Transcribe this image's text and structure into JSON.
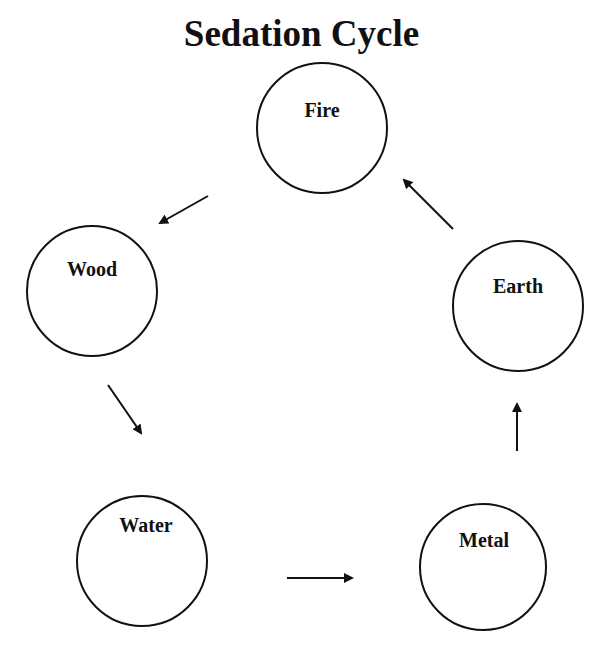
{
  "title": "Sedation Cycle",
  "colors": {
    "stroke": "#111111",
    "background": "#ffffff"
  },
  "nodes": [
    {
      "id": "fire",
      "label": "Fire",
      "cx": 322,
      "cy": 128,
      "r": 65
    },
    {
      "id": "wood",
      "label": "Wood",
      "cx": 92,
      "cy": 291,
      "r": 65
    },
    {
      "id": "earth",
      "label": "Earth",
      "cx": 518,
      "cy": 306,
      "r": 65
    },
    {
      "id": "water",
      "label": "Water",
      "cx": 142,
      "cy": 561,
      "r": 65
    },
    {
      "id": "metal",
      "label": "Metal",
      "cx": 483,
      "cy": 567,
      "r": 63
    }
  ],
  "edges": [
    {
      "from": "Fire",
      "to": "Wood",
      "x1": 208,
      "y1": 196,
      "x2": 160,
      "y2": 223
    },
    {
      "from": "Wood",
      "to": "Water",
      "x1": 108,
      "y1": 385,
      "x2": 141,
      "y2": 433
    },
    {
      "from": "Water",
      "to": "Metal",
      "x1": 287,
      "y1": 578,
      "x2": 352,
      "y2": 578
    },
    {
      "from": "Metal",
      "to": "Earth",
      "x1": 517,
      "y1": 451,
      "x2": 517,
      "y2": 404
    },
    {
      "from": "Earth",
      "to": "Fire",
      "x1": 453,
      "y1": 229,
      "x2": 404,
      "y2": 180
    }
  ]
}
